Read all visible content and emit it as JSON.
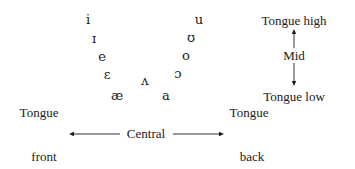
{
  "vowels": {
    "front": [
      {
        "symbol": "i",
        "x": 88,
        "y": 19
      },
      {
        "symbol": "ɪ",
        "x": 94,
        "y": 38
      },
      {
        "symbol": "e",
        "x": 102,
        "y": 56
      },
      {
        "symbol": "ɛ",
        "x": 107,
        "y": 74
      },
      {
        "symbol": "æ",
        "x": 117,
        "y": 95
      }
    ],
    "central": [
      {
        "symbol": "ʌ",
        "x": 145,
        "y": 80
      },
      {
        "symbol": "a",
        "x": 166,
        "y": 95
      }
    ],
    "back": [
      {
        "symbol": "u",
        "x": 199,
        "y": 19
      },
      {
        "symbol": "ʊ",
        "x": 191,
        "y": 37
      },
      {
        "symbol": "o",
        "x": 186,
        "y": 55
      },
      {
        "symbol": "ɔ",
        "x": 178,
        "y": 73
      }
    ]
  },
  "height_scale": {
    "high": "Tongue high",
    "mid": "Mid",
    "low": "Tongue low"
  },
  "position_scale": {
    "front_top": "Tongue",
    "front_bottom": "front",
    "central": "Central",
    "back_top": "Tongue",
    "back_bottom": "back"
  }
}
